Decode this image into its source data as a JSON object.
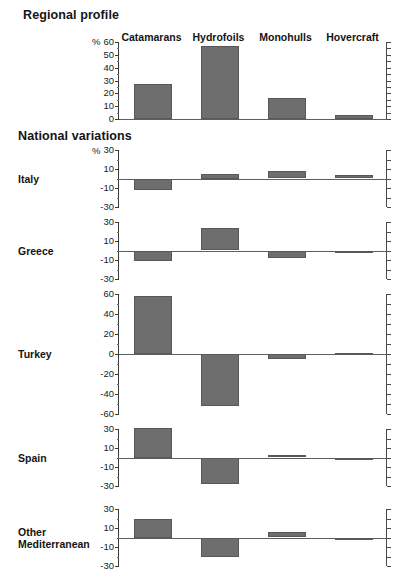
{
  "figure": {
    "sections": {
      "regional_title": "Regional profile",
      "national_title": "National variations"
    },
    "percent_symbol": "%",
    "categories": [
      "Catamarans",
      "Hydrofoils",
      "Monohulls",
      "Hovercraft"
    ],
    "bar_color": "#6e6e6e",
    "axis_color": "#3b3b3b"
  },
  "chart_data": [
    {
      "type": "bar",
      "title": "Regional profile",
      "categories": [
        "Catamarans",
        "Hydrofoils",
        "Monohulls",
        "Hovercraft"
      ],
      "values": [
        27,
        57,
        16,
        3
      ],
      "xlabel": "",
      "ylabel": "%",
      "ylim": [
        0,
        60
      ],
      "yticks": [
        0,
        10,
        20,
        30,
        40,
        50,
        60
      ],
      "grid": false,
      "legend": "none"
    },
    {
      "type": "bar",
      "title": "Italy",
      "categories": [
        "Catamarans",
        "Hydrofoils",
        "Monohulls",
        "Hovercraft"
      ],
      "values": [
        -12,
        5,
        8,
        4
      ],
      "xlabel": "",
      "ylabel": "%",
      "ylim": [
        -30,
        30
      ],
      "yticks": [
        -30,
        -10,
        10,
        30
      ],
      "grid": false,
      "legend": "none"
    },
    {
      "type": "bar",
      "title": "Greece",
      "categories": [
        "Catamarans",
        "Hydrofoils",
        "Monohulls",
        "Hovercraft"
      ],
      "values": [
        -11,
        24,
        -8,
        -1
      ],
      "xlabel": "",
      "ylabel": "",
      "ylim": [
        -30,
        30
      ],
      "yticks": [
        -30,
        -10,
        10,
        30
      ],
      "grid": false,
      "legend": "none"
    },
    {
      "type": "bar",
      "title": "Turkey",
      "categories": [
        "Catamarans",
        "Hydrofoils",
        "Monohulls",
        "Hovercraft"
      ],
      "values": [
        58,
        -52,
        -5,
        1
      ],
      "xlabel": "",
      "ylabel": "",
      "ylim": [
        -60,
        60
      ],
      "yticks": [
        -60,
        -40,
        -20,
        0,
        20,
        40,
        60
      ],
      "grid": false,
      "legend": "none"
    },
    {
      "type": "bar",
      "title": "Spain",
      "categories": [
        "Catamarans",
        "Hydrofoils",
        "Monohulls",
        "Hovercraft"
      ],
      "values": [
        31,
        -28,
        3,
        -2
      ],
      "xlabel": "",
      "ylabel": "",
      "ylim": [
        -30,
        30
      ],
      "yticks": [
        -30,
        -10,
        10,
        30
      ],
      "grid": false,
      "legend": "none"
    },
    {
      "type": "bar",
      "title": "Other Mediterranean",
      "categories": [
        "Catamarans",
        "Hydrofoils",
        "Monohulls",
        "Hovercraft"
      ],
      "values": [
        20,
        -21,
        6,
        -1
      ],
      "xlabel": "",
      "ylabel": "",
      "ylim": [
        -30,
        30
      ],
      "yticks": [
        -30,
        -10,
        10,
        30
      ],
      "grid": false,
      "legend": "none"
    }
  ],
  "panel_labels": {
    "italy": "Italy",
    "greece": "Greece",
    "turkey": "Turkey",
    "spain": "Spain",
    "other_line1": "Other",
    "other_line2": "Mediterranean"
  }
}
